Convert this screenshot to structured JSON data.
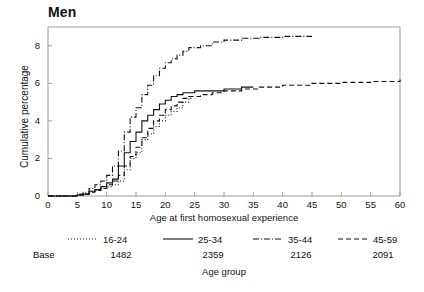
{
  "chart_data": {
    "type": "line",
    "title": "Men",
    "xlabel": "Age at first homosexual experience",
    "ylabel": "Cumulative percentage",
    "xlim": [
      0,
      60
    ],
    "ylim": [
      0,
      9
    ],
    "xticks": [
      0,
      5,
      10,
      15,
      20,
      25,
      30,
      35,
      40,
      45,
      50,
      55,
      60
    ],
    "yticks": [
      0,
      2,
      4,
      6,
      8
    ],
    "grid": false,
    "legend_position": "below-axes",
    "legend_title": "Age group",
    "base_label": "Base",
    "series": [
      {
        "name": "16-24",
        "base": "1482",
        "linestyle": "dotted",
        "points": [
          [
            0,
            0
          ],
          [
            4,
            0
          ],
          [
            5,
            0.05
          ],
          [
            6,
            0.1
          ],
          [
            7,
            0.2
          ],
          [
            8,
            0.3
          ],
          [
            9,
            0.4
          ],
          [
            10,
            0.5
          ],
          [
            11,
            0.6
          ],
          [
            12,
            0.8
          ],
          [
            13,
            1.4
          ],
          [
            14,
            2.0
          ],
          [
            15,
            2.3
          ],
          [
            16,
            3.0
          ],
          [
            17,
            3.3
          ],
          [
            18,
            3.7
          ],
          [
            19,
            4.0
          ],
          [
            20,
            4.3
          ],
          [
            21,
            4.5
          ],
          [
            22,
            4.7
          ],
          [
            23,
            5.0
          ],
          [
            24,
            5.2
          ],
          [
            24.5,
            5.3
          ]
        ]
      },
      {
        "name": "25-34",
        "base": "2359",
        "linestyle": "solid",
        "points": [
          [
            0,
            0
          ],
          [
            4,
            0
          ],
          [
            5,
            0.05
          ],
          [
            6,
            0.1
          ],
          [
            7,
            0.25
          ],
          [
            8,
            0.35
          ],
          [
            9,
            0.5
          ],
          [
            10,
            0.7
          ],
          [
            11,
            0.9
          ],
          [
            12,
            1.6
          ],
          [
            13,
            2.3
          ],
          [
            14,
            2.9
          ],
          [
            15,
            3.4
          ],
          [
            16,
            4.0
          ],
          [
            17,
            4.3
          ],
          [
            18,
            4.6
          ],
          [
            19,
            4.9
          ],
          [
            20,
            5.1
          ],
          [
            21,
            5.3
          ],
          [
            22,
            5.4
          ],
          [
            23,
            5.5
          ],
          [
            25,
            5.6
          ],
          [
            27,
            5.6
          ],
          [
            30,
            5.7
          ],
          [
            33,
            5.8
          ],
          [
            35,
            5.8
          ]
        ]
      },
      {
        "name": "35-44",
        "base": "2126",
        "linestyle": "dashdot",
        "points": [
          [
            0,
            0
          ],
          [
            4,
            0
          ],
          [
            5,
            0.1
          ],
          [
            6,
            0.2
          ],
          [
            7,
            0.4
          ],
          [
            8,
            0.6
          ],
          [
            9,
            0.8
          ],
          [
            10,
            1.1
          ],
          [
            11,
            1.6
          ],
          [
            12,
            2.4
          ],
          [
            13,
            3.4
          ],
          [
            14,
            4.2
          ],
          [
            15,
            4.7
          ],
          [
            16,
            5.4
          ],
          [
            17,
            5.9
          ],
          [
            18,
            6.4
          ],
          [
            19,
            6.8
          ],
          [
            20,
            7.1
          ],
          [
            21,
            7.3
          ],
          [
            22,
            7.5
          ],
          [
            23,
            7.7
          ],
          [
            24,
            7.9
          ],
          [
            26,
            8.0
          ],
          [
            28,
            8.2
          ],
          [
            30,
            8.3
          ],
          [
            33,
            8.4
          ],
          [
            36,
            8.45
          ],
          [
            40,
            8.5
          ],
          [
            45,
            8.5
          ]
        ]
      },
      {
        "name": "45-59",
        "base": "2091",
        "linestyle": "dashed",
        "points": [
          [
            0,
            0
          ],
          [
            4,
            0
          ],
          [
            5,
            0.05
          ],
          [
            6,
            0.1
          ],
          [
            7,
            0.2
          ],
          [
            8,
            0.3
          ],
          [
            9,
            0.4
          ],
          [
            10,
            0.6
          ],
          [
            11,
            0.8
          ],
          [
            12,
            1.1
          ],
          [
            13,
            1.6
          ],
          [
            14,
            2.1
          ],
          [
            15,
            2.6
          ],
          [
            16,
            3.1
          ],
          [
            17,
            3.6
          ],
          [
            18,
            4.0
          ],
          [
            19,
            4.3
          ],
          [
            20,
            4.6
          ],
          [
            21,
            4.8
          ],
          [
            22,
            5.0
          ],
          [
            23,
            5.2
          ],
          [
            24,
            5.3
          ],
          [
            26,
            5.4
          ],
          [
            28,
            5.5
          ],
          [
            30,
            5.6
          ],
          [
            33,
            5.7
          ],
          [
            36,
            5.8
          ],
          [
            40,
            5.9
          ],
          [
            45,
            6.0
          ],
          [
            50,
            6.05
          ],
          [
            55,
            6.1
          ],
          [
            60,
            6.2
          ]
        ]
      }
    ]
  }
}
